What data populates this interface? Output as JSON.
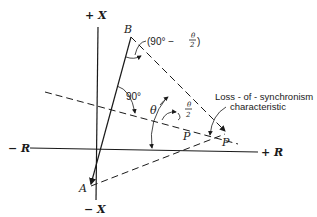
{
  "axes": {
    "pos_x": "+ X",
    "neg_x": "− X",
    "pos_r": "+ R",
    "neg_r": "− R"
  },
  "points": {
    "a": "A",
    "b": "B",
    "p": "P"
  },
  "angles": {
    "right_angle": "90°",
    "theta": "θ",
    "half_theta_num": "θ",
    "half_theta_den": "2",
    "complement_prefix": "(90° −",
    "complement_num": "θ",
    "complement_den": "2",
    "complement_suffix": ")"
  },
  "annotation": {
    "line1": "Loss - of - synchronism",
    "line2": "characteristic"
  }
}
